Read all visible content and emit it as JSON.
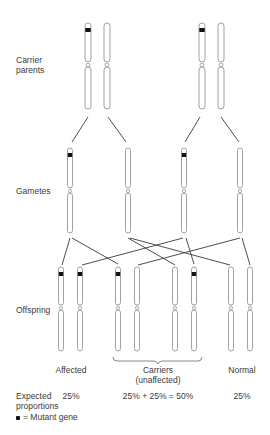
{
  "rows": {
    "carrier_parents": "Carrier\nparents",
    "carrier_parents_line1": "Carrier",
    "carrier_parents_line2": "parents",
    "gametes": "Gametes",
    "offspring": "Offspring"
  },
  "categories": {
    "affected": "Affected",
    "carriers_line1": "Carriers",
    "carriers_line2": "(unaffected)",
    "normal": "Normal"
  },
  "proportions": {
    "label_line1": "Expected",
    "label_line2": "proportions",
    "affected": "25%",
    "carriers": "25% + 25% = 50%",
    "normal": "25%"
  },
  "legend": {
    "symbol": "●",
    "text": "= Mutant gene"
  },
  "colors": {
    "outline": "#8a8a8a",
    "mutant": "#111111",
    "line": "#3a3a3a",
    "text": "#3a3a3a"
  },
  "diagram": {
    "parents": [
      {
        "x": 88,
        "mutant": true
      },
      {
        "x": 107,
        "mutant": false
      },
      {
        "x": 202,
        "mutant": true
      },
      {
        "x": 221,
        "mutant": false
      }
    ],
    "gametes": [
      {
        "x": 70,
        "mutant": true
      },
      {
        "x": 128,
        "mutant": false
      },
      {
        "x": 184,
        "mutant": true
      },
      {
        "x": 240,
        "mutant": false
      }
    ],
    "offspring": [
      {
        "x": 61,
        "mutant": true,
        "group": "affected"
      },
      {
        "x": 80,
        "mutant": true,
        "group": "affected"
      },
      {
        "x": 118,
        "mutant": true,
        "group": "carrier"
      },
      {
        "x": 137,
        "mutant": false,
        "group": "carrier"
      },
      {
        "x": 175,
        "mutant": false,
        "group": "carrier"
      },
      {
        "x": 194,
        "mutant": true,
        "group": "carrier"
      },
      {
        "x": 231,
        "mutant": false,
        "group": "normal"
      },
      {
        "x": 250,
        "mutant": false,
        "group": "normal"
      }
    ],
    "parent_to_gamete_lines": [
      [
        88,
        117,
        72,
        142
      ],
      [
        108,
        117,
        126,
        142
      ],
      [
        200,
        117,
        185,
        142
      ],
      [
        221,
        117,
        239,
        142
      ]
    ],
    "gamete_to_offspring_lines": [
      [
        70,
        238,
        62,
        265
      ],
      [
        72,
        238,
        118,
        264
      ],
      [
        128,
        238,
        175,
        265
      ],
      [
        130,
        238,
        230,
        265
      ],
      [
        183,
        238,
        82,
        265
      ],
      [
        186,
        238,
        194,
        264
      ],
      [
        240,
        238,
        138,
        265
      ],
      [
        242,
        238,
        250,
        265
      ]
    ]
  }
}
